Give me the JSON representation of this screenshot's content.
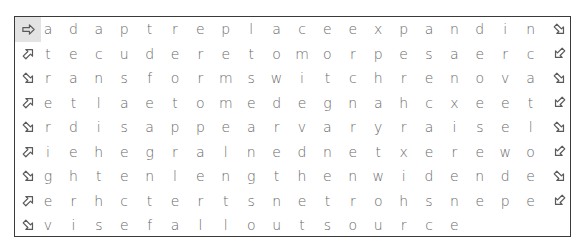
{
  "puzzle": {
    "type": "word-search",
    "rows": [
      {
        "left_icon": "arrow-right-icon",
        "left_active": true,
        "letters": [
          "a",
          "d",
          "a",
          "p",
          "t",
          "r",
          "e",
          "p",
          "l",
          "a",
          "c",
          "e",
          "e",
          "x",
          "p",
          "a",
          "n",
          "d",
          "i",
          "n"
        ],
        "right_icon": "arrow-down-right-icon"
      },
      {
        "left_icon": "arrow-up-right-icon",
        "left_active": false,
        "letters": [
          "t",
          "e",
          "c",
          "u",
          "d",
          "e",
          "r",
          "e",
          "t",
          "o",
          "m",
          "o",
          "r",
          "p",
          "e",
          "s",
          "a",
          "e",
          "r",
          "c"
        ],
        "right_icon": "arrow-down-left-icon"
      },
      {
        "left_icon": "arrow-down-right-icon",
        "left_active": false,
        "letters": [
          "r",
          "a",
          "n",
          "s",
          "f",
          "o",
          "r",
          "m",
          "s",
          "w",
          "i",
          "t",
          "c",
          "h",
          "r",
          "e",
          "n",
          "o",
          "v",
          "a"
        ],
        "right_icon": "arrow-down-right-icon"
      },
      {
        "left_icon": "arrow-up-right-icon",
        "left_active": false,
        "letters": [
          "e",
          "t",
          "l",
          "a",
          "e",
          "t",
          "o",
          "m",
          "e",
          "d",
          "e",
          "g",
          "n",
          "a",
          "h",
          "c",
          "x",
          "e",
          "e",
          "t"
        ],
        "right_icon": "arrow-down-left-icon"
      },
      {
        "left_icon": "arrow-down-right-icon",
        "left_active": false,
        "letters": [
          "r",
          "d",
          "i",
          "s",
          "a",
          "p",
          "p",
          "e",
          "a",
          "r",
          "v",
          "a",
          "r",
          "y",
          "r",
          "a",
          "i",
          "s",
          "e",
          "l"
        ],
        "right_icon": "arrow-down-right-icon"
      },
      {
        "left_icon": "arrow-up-right-icon",
        "left_active": false,
        "letters": [
          "i",
          "e",
          "h",
          "e",
          "g",
          "r",
          "a",
          "l",
          "n",
          "e",
          "d",
          "n",
          "e",
          "t",
          "x",
          "e",
          "r",
          "e",
          "w",
          "o"
        ],
        "right_icon": "arrow-down-left-icon"
      },
      {
        "left_icon": "arrow-down-right-icon",
        "left_active": false,
        "letters": [
          "g",
          "h",
          "t",
          "e",
          "n",
          "l",
          "e",
          "n",
          "g",
          "t",
          "h",
          "e",
          "n",
          "w",
          "i",
          "d",
          "e",
          "n",
          "d",
          "e"
        ],
        "right_icon": "arrow-down-right-icon"
      },
      {
        "left_icon": "arrow-up-right-icon",
        "left_active": false,
        "letters": [
          "e",
          "r",
          "h",
          "c",
          "t",
          "e",
          "r",
          "t",
          "s",
          "n",
          "e",
          "t",
          "r",
          "o",
          "h",
          "s",
          "n",
          "e",
          "p",
          "e"
        ],
        "right_icon": "arrow-down-left-icon"
      },
      {
        "left_icon": "arrow-down-right-icon",
        "left_active": false,
        "letters": [
          "v",
          "i",
          "s",
          "e",
          "f",
          "a",
          "l",
          "l",
          "o",
          "u",
          "t",
          "s",
          "o",
          "u",
          "r",
          "c",
          "e"
        ],
        "right_icon": null
      }
    ]
  },
  "colors": {
    "border": "#3a3a3a",
    "letter": "#6a6a6a",
    "icon": "#5a5a5a",
    "active_cell": "#e3e3e3"
  }
}
